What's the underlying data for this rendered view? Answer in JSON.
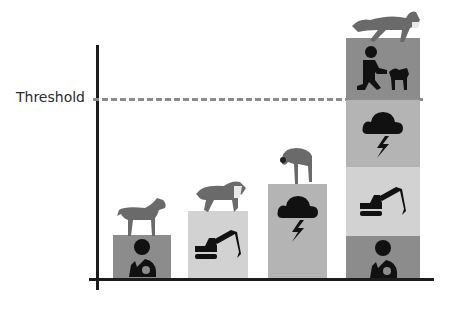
{
  "threshold": {
    "label": "Threshold",
    "line_color": "#8a8a8a"
  },
  "colors": {
    "dark": "#8c8c8c",
    "light": "#d2d2d2",
    "mid": "#b4b4b4",
    "icon": "#111111",
    "dog": "#6a6a6a"
  },
  "stacks": [
    {
      "name": "stack-1",
      "segments": [
        "vet-person-with-dog-icon"
      ]
    },
    {
      "name": "stack-2",
      "segments": [
        "excavator-icon"
      ]
    },
    {
      "name": "stack-3",
      "segments": [
        "storm-cloud-icon"
      ]
    },
    {
      "name": "stack-4",
      "segments": [
        "trainer-with-dog-icon",
        "storm-cloud-icon",
        "excavator-icon",
        "vet-person-with-dog-icon"
      ]
    }
  ]
}
